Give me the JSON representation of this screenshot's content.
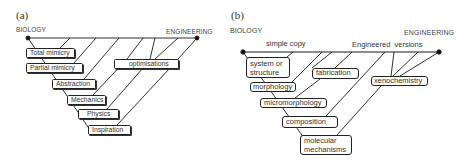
{
  "panel_a": {
    "label": "(a)",
    "left_end": "BIOLOGY",
    "right_end": "ENGINEERING",
    "boxes": [
      {
        "label": "Total mimicry"
      },
      {
        "label": "Partial mimicry"
      },
      {
        "label": "Abstraction"
      },
      {
        "label": "Mechanics"
      },
      {
        "label": "Physics"
      },
      {
        "label": "Inspiration"
      },
      {
        "label": "optimisations"
      }
    ]
  },
  "panel_b": {
    "label": "(b)",
    "left_end": "BIOLOGY",
    "right_end": "ENGINEERING",
    "annotations": {
      "left": "simple copy",
      "right": "Engineered  versions"
    },
    "boxes": [
      {
        "label": "system or structure"
      },
      {
        "label": "morphology"
      },
      {
        "label": "micromorphology"
      },
      {
        "label": "composition"
      },
      {
        "label": "molecular mechanisms"
      },
      {
        "label": "fabrication"
      },
      {
        "label": "xenochemistry"
      }
    ]
  },
  "colors": {
    "line": "#1a1a1a",
    "text": "#333333",
    "background": "#ffffff"
  }
}
